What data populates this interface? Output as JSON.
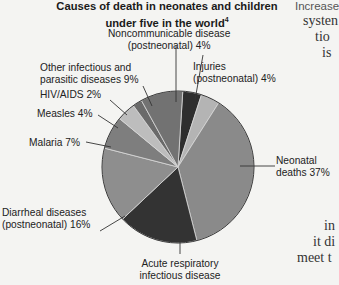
{
  "chart_data": {
    "type": "pie",
    "title": "Causes of death in neonates and children under five in the world",
    "title_superscript": "4",
    "slices": [
      {
        "label": "Noncommunicable disease (postneonatal)",
        "value": 4,
        "color": "#2e2e2e"
      },
      {
        "label": "Injuries (postneonatal)",
        "value": 4,
        "color": "#b4b4b4"
      },
      {
        "label": "Neonatal deaths",
        "value": 37,
        "color": "#8a8a8a"
      },
      {
        "label": "Acute respiratory infectious disease",
        "value": 17,
        "color": "#333333"
      },
      {
        "label": "Diarrheal diseases (postneonatal)",
        "value": 16,
        "color": "#8e8e8e"
      },
      {
        "label": "Malaria",
        "value": 7,
        "color": "#7e7e7e"
      },
      {
        "label": "Measles",
        "value": 4,
        "color": "#bdbdbd"
      },
      {
        "label": "HIV/AIDS",
        "value": 2,
        "color": "#6a6a6a"
      },
      {
        "label": "Other infectious and parasitic diseases",
        "value": 9,
        "color": "#727272"
      }
    ],
    "start_angle_deg": -86.4,
    "direction": "clockwise"
  },
  "title": {
    "line1": "Causes of death in neonates and children",
    "line2": "under five in the world",
    "sup": "4"
  },
  "labels": {
    "noncomm": {
      "line1": "Noncommunicable disease",
      "line2": "(postneonatal) 4%"
    },
    "injuries": {
      "line1": "Injuries",
      "line2": "(postneonatal) 4%"
    },
    "other": {
      "line1": "Other infectious and",
      "line2": "parasitic diseases 9%"
    },
    "hiv": "HIV/AIDS 2%",
    "measles": "Measles 4%",
    "malaria": "Malaria 7%",
    "neonatal": {
      "line1": "Neonatal",
      "line2": "deaths 37%"
    },
    "diarrheal": {
      "line1": "Diarrheal diseases",
      "line2": "(postneonatal) 16%"
    },
    "acute": {
      "line1": "Acute respiratory",
      "line2": "infectious disease"
    }
  },
  "side_text": {
    "heading": "Increase",
    "lines": [
      "systen",
      "tio",
      "is",
      "in",
      "it di",
      "meet t"
    ]
  }
}
